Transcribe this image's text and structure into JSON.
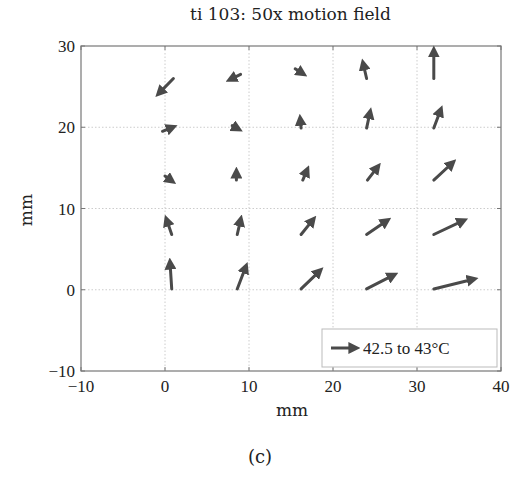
{
  "chart_data": {
    "type": "quiver",
    "title": "ti 103: 50x motion field",
    "xlabel": "mm",
    "ylabel": "mm",
    "caption": "(c)",
    "xlim": [
      -10,
      40
    ],
    "ylim": [
      -10,
      30
    ],
    "xticks": [
      "-10",
      "0",
      "10",
      "20",
      "30",
      "40"
    ],
    "yticks": [
      "-10",
      "0",
      "10",
      "20",
      "30"
    ],
    "grid": true,
    "legend": {
      "label": "42.5 to 43°C",
      "position": "lower right"
    },
    "color": "#4a4a4a",
    "arrows": [
      {
        "x": 1,
        "y": 26,
        "dx": -1.7,
        "dy": -1.8
      },
      {
        "x": 9,
        "y": 26.5,
        "dx": -1.2,
        "dy": -0.6
      },
      {
        "x": 15.5,
        "y": 27.2,
        "dx": 0.9,
        "dy": -0.6
      },
      {
        "x": 24,
        "y": 26,
        "dx": -0.4,
        "dy": 1.8
      },
      {
        "x": 32,
        "y": 26,
        "dx": 0,
        "dy": 3.4
      },
      {
        "x": -0.3,
        "y": 19.5,
        "dx": 1.2,
        "dy": 0.5
      },
      {
        "x": 8,
        "y": 20.2,
        "dx": 0.7,
        "dy": -0.4
      },
      {
        "x": 16.2,
        "y": 19.9,
        "dx": -0.1,
        "dy": 1.1
      },
      {
        "x": 24,
        "y": 19.9,
        "dx": 0.4,
        "dy": 1.9
      },
      {
        "x": 32,
        "y": 19.9,
        "dx": 0.8,
        "dy": 2.2
      },
      {
        "x": 0,
        "y": 14,
        "dx": 0.8,
        "dy": -0.6
      },
      {
        "x": 8.5,
        "y": 13.5,
        "dx": 0,
        "dy": 1
      },
      {
        "x": 16.4,
        "y": 13.5,
        "dx": 0.5,
        "dy": 1.2
      },
      {
        "x": 24.1,
        "y": 13.5,
        "dx": 1.2,
        "dy": 1.6
      },
      {
        "x": 32,
        "y": 13.5,
        "dx": 2.2,
        "dy": 2.1
      },
      {
        "x": 0.8,
        "y": 6.8,
        "dx": -0.6,
        "dy": 1.8
      },
      {
        "x": 8.6,
        "y": 6.8,
        "dx": 0.4,
        "dy": 1.8
      },
      {
        "x": 16.2,
        "y": 6.8,
        "dx": 1.4,
        "dy": 1.8
      },
      {
        "x": 24,
        "y": 6.8,
        "dx": 2.4,
        "dy": 1.7
      },
      {
        "x": 32,
        "y": 6.8,
        "dx": 3.5,
        "dy": 1.7
      },
      {
        "x": 0.8,
        "y": 0.1,
        "dx": -0.2,
        "dy": 3.2
      },
      {
        "x": 8.6,
        "y": 0.1,
        "dx": 1,
        "dy": 2.7
      },
      {
        "x": 16.2,
        "y": 0.1,
        "dx": 2.2,
        "dy": 2.2
      },
      {
        "x": 24,
        "y": 0.1,
        "dx": 3.2,
        "dy": 1.7
      },
      {
        "x": 32,
        "y": 0.1,
        "dx": 4.7,
        "dy": 1.2
      }
    ]
  }
}
